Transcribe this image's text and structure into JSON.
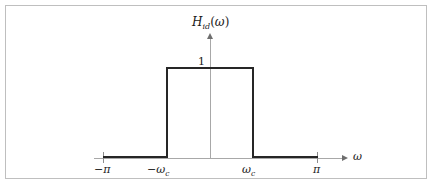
{
  "chart_data": {
    "type": "line",
    "title_base": "H",
    "title_subscript": "id",
    "title_arg": "(ω)",
    "xlabel": "ω",
    "ylabel": "",
    "xlim": [
      -3.14159,
      3.14159
    ],
    "ylim": [
      0,
      1.25
    ],
    "grid": false,
    "legend": null,
    "x_tick_labels": [
      "−π",
      "−ωc",
      "ωc",
      "π"
    ],
    "x_tick_values": [
      -3.14159,
      -0.82,
      0.82,
      3.14159
    ],
    "y_tick_labels": [
      "1"
    ],
    "y_tick_values": [
      1
    ],
    "cutoff_label": "ωc",
    "passband_value": 1,
    "stopband_value": 0,
    "series": [
      {
        "name": "H_id(ω)",
        "x": [
          -3.14159,
          -0.82,
          -0.82,
          0.82,
          0.82,
          3.14159
        ],
        "values": [
          0,
          0,
          1,
          1,
          0,
          0
        ],
        "color": "#262626"
      }
    ]
  },
  "labels": {
    "title_base": "H",
    "title_subscript": "id",
    "title_open": "(",
    "title_omega": "ω",
    "title_close": ")",
    "y_one": "1",
    "omega_axis": "ω",
    "neg_pi": "−π",
    "pos_pi": "π",
    "neg_omega": "−ω",
    "neg_omega_sub": "c",
    "pos_omega": "ω",
    "pos_omega_sub": "c"
  },
  "colors": {
    "curve": "#262626",
    "axis": "#a8a8a8",
    "tick": "#8c8c8c",
    "frame": "#bfbfbf",
    "background": "#ffffff",
    "text": "#1a1a1a"
  }
}
